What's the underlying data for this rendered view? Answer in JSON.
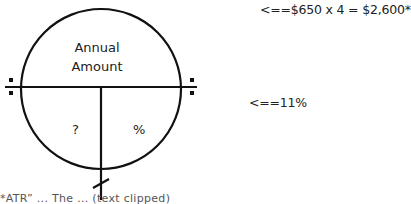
{
  "diagram": {
    "type": "annual-amount-circle",
    "top_section": {
      "line1": "Annual",
      "line2": "Amount"
    },
    "bottom_left": {
      "label": "?"
    },
    "bottom_right": {
      "label": "%"
    },
    "stroke_color": "#111111"
  },
  "annotations": {
    "annual_amount": "<==$650 x 4 = $2,600*",
    "percent": "<==11%"
  },
  "footnote": {
    "text": "*ATR” ... The ... (text clipped)"
  }
}
